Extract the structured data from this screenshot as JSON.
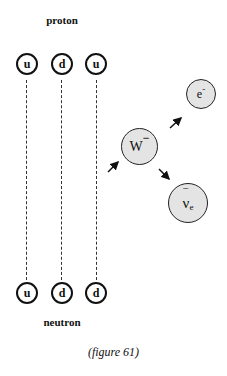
{
  "diagram": {
    "top_label": "proton",
    "bottom_label": "neutron",
    "caption": "(figure 61)",
    "proton_quarks": [
      {
        "flavor": "u"
      },
      {
        "flavor": "d"
      },
      {
        "flavor": "u"
      }
    ],
    "neutron_quarks": [
      {
        "flavor": "u"
      },
      {
        "flavor": "d"
      },
      {
        "flavor": "d"
      }
    ],
    "particles": {
      "w_boson": {
        "symbol": "W",
        "charge": "−"
      },
      "electron": {
        "symbol": "e",
        "charge": "-"
      },
      "antineutrino": {
        "symbol": "ν",
        "bar": "‾",
        "subscript": "e"
      }
    },
    "colors": {
      "particle_fill": "#e4e4e4",
      "stroke": "#111111"
    }
  }
}
